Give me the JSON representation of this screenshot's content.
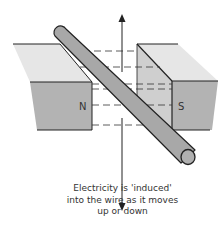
{
  "diagram": {
    "magnets": {
      "north_label": "N",
      "south_label": "S"
    },
    "motion_arrow": "vertical double-headed arrow (up/down movement)",
    "caption": {
      "line1": "Electricity is 'induced'",
      "line2": "into the wire as it moves",
      "line3": "up or down"
    },
    "colors": {
      "magnet_top": "#e6e6e6",
      "magnet_front": "#b3b3b3",
      "magnet_side": "#cfcfcf",
      "wire": "#a8a8a8",
      "outline": "#222222",
      "text": "#333333"
    }
  }
}
